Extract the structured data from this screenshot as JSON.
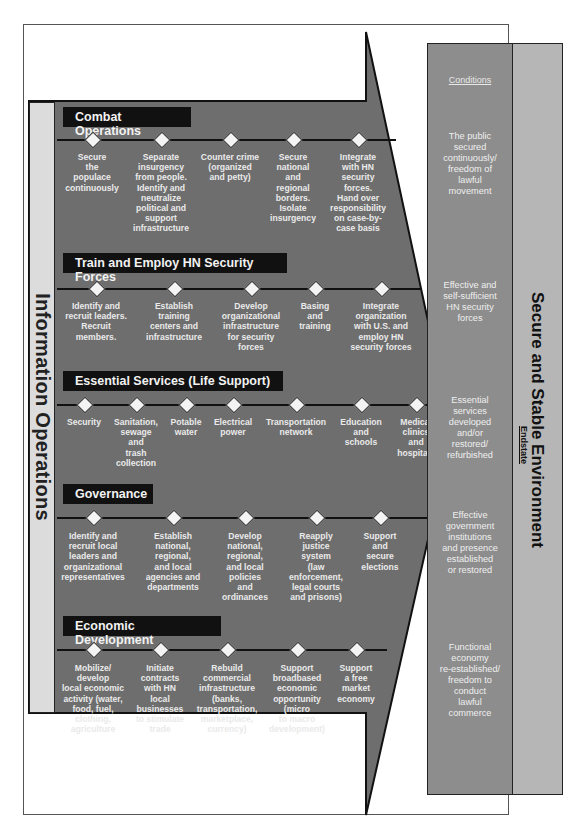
{
  "left_column": {
    "label": "Information Operations"
  },
  "lines_of_operation": [
    {
      "title": "Combat Operations",
      "items": [
        "Secure\nthe\npopulace\ncontinuously",
        "Separate\ninsurgency\nfrom people.\nIdentify and\nneutralize\npolitical and\nsupport\ninfrastructure",
        "Counter crime\n(organized\nand petty)",
        "Secure\nnational\nand\nregional\nborders.\nIsolate\ninsurgency",
        "Integrate\nwith HN\nsecurity\nforces.\nHand over\nresponsibility\non case-by-\ncase basis"
      ]
    },
    {
      "title": "Train and Employ HN Security Forces",
      "items": [
        "Identify and\nrecruit leaders.\nRecruit\nmembers.",
        "Establish\ntraining\ncenters and\ninfrastructure",
        "Develop\norganizational\ninfrastructure\nfor security\nforces",
        "Basing\nand\ntraining",
        "Integrate\norganization\nwith U.S. and\nemploy HN\nsecurity forces"
      ]
    },
    {
      "title": "Essential Services (Life Support)",
      "items": [
        "Security",
        "Sanitation,\nsewage\nand\ntrash\ncollection",
        "Potable\nwater",
        "Electrical\npower",
        "Transportation\nnetwork",
        "Education\nand\nschools",
        "Medical\nclinics\nand\nhospitals"
      ]
    },
    {
      "title": "Governance",
      "items": [
        "Identify and\nrecruit local\nleaders and\norganizational\nrepresentatives",
        "Establish\nnational,\nregional,\nand local\nagencies and\ndepartments",
        "Develop\nnational,\nregional,\nand local\npolicies\nand\nordinances",
        "Reapply\njustice\nsystem\n(law\nenforcement,\nlegal courts\nand prisons)",
        "Support\nand\nsecure\nelections"
      ]
    },
    {
      "title": "Economic Development",
      "items": [
        "Mobilize/\ndevelop\nlocal economic\nactivity (water,\nfood, fuel,\nclothing,\nagriculture",
        "Initiate\ncontracts\nwith HN\nlocal\nbusinesses\nto stimulate\ntrade",
        "Rebuild\ncommercial\ninfrastructure\n(banks,\ntransportation,\nmarketplace,\ncurrency)",
        "Support\nbroadbased\neconomic\nopportunity\n(micro\nto macro\ndevelopment)",
        "Support\na free\nmarket\neconomy"
      ]
    }
  ],
  "conditions": {
    "header": "Conditions",
    "items": [
      "The public\nsecured\ncontinuously/\nfreedom of\nlawful\nmovement",
      "Effective and\nself-sufficient\nHN security\nforces",
      "Essential\nservices\ndeveloped\nand/or\nrestored/\nrefurbished",
      "Effective\ngovernment\ninstitutions\nand presence\nestablished\nor restored",
      "Functional\neconomy\nre-established/\nfreedom to\nconduct\nlawful\ncommerce"
    ]
  },
  "endstate": {
    "label": "Endstate",
    "title": "Secure and Stable Environment"
  },
  "colors": {
    "arrow_fill": "#6e6e6e",
    "title_bar": "#111111",
    "conditions_fill": "#8d8d8d",
    "endstate_fill": "#b6b6b6",
    "io_fill": "#dcdcdc"
  }
}
